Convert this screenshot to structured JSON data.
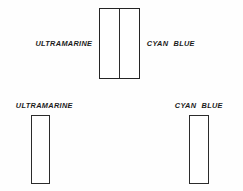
{
  "figure": {
    "ink_color": "#2b2b2b",
    "background_color": "#ffffff"
  },
  "top_pair": {
    "left_label": "ULTRAMARINE",
    "right_label": "CYAN BLUE"
  },
  "bottom_left": {
    "label": "ULTRAMARINE"
  },
  "bottom_right": {
    "label": "CYAN BLUE"
  }
}
